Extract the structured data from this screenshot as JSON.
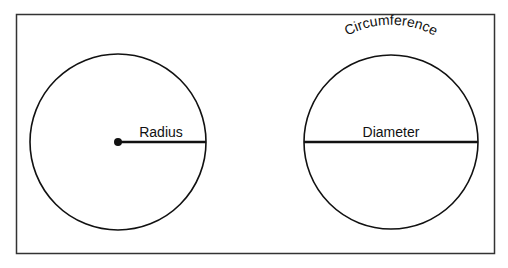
{
  "diagram": {
    "frame": {
      "x": 16,
      "y": 14,
      "width": 478,
      "height": 239,
      "stroke": "#333333"
    },
    "left_circle": {
      "cx": 118,
      "cy": 142,
      "r": 88,
      "segment_label": "Radius",
      "segment_type": "radius"
    },
    "right_circle": {
      "cx": 391,
      "cy": 142,
      "r": 87,
      "segment_label": "Diameter",
      "segment_type": "diameter",
      "arc_label": "Circumference"
    },
    "stroke_color": "#111111"
  }
}
